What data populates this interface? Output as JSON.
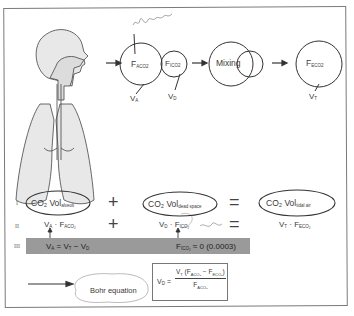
{
  "diagram": {
    "compartments": [
      {
        "id": "alveolar",
        "label": "F",
        "sub": "ACO2",
        "volume": "V",
        "volume_sub": "A"
      },
      {
        "id": "dead_space",
        "label": "F",
        "sub": "ICO2",
        "volume": "V",
        "volume_sub": "D"
      },
      {
        "id": "mixing",
        "label": "Mixing"
      },
      {
        "id": "expired",
        "label": "F",
        "sub": "ECO2",
        "volume": "V",
        "volume_sub": "T"
      }
    ],
    "handwritten_note_top": "fraction",
    "handwritten_note_mid": "~ V/g..."
  },
  "rows": {
    "row1": {
      "numeral": "I",
      "term1": {
        "main": "CO₂ Vol",
        "sub": "alveoli"
      },
      "op1": "+",
      "term2": {
        "main": "CO₂ Vol",
        "sub": "dead space"
      },
      "op2": "=",
      "term3": {
        "main": "CO₂ Vol",
        "sub": "tidal air"
      }
    },
    "row2": {
      "numeral": "II",
      "term1": {
        "a": "V",
        "a_sub": "A",
        "dot": " · F",
        "b_sub": "ACO₂"
      },
      "op1": "+",
      "term2": {
        "a": "V",
        "a_sub": "D",
        "dot": " · F",
        "b_sub": "ICO₂"
      },
      "op2": "=",
      "term3": {
        "a": "V",
        "a_sub": "T",
        "dot": " · F",
        "b_sub": "ECO₂"
      }
    },
    "row3": {
      "numeral": "III",
      "left": {
        "a": "V",
        "a_sub": "A",
        "rest1": " = V",
        "b_sub": "T",
        "rest2": " − V",
        "c_sub": "D"
      },
      "right": {
        "a": "F",
        "a_sub": "ICO₂",
        "rest": " ≈ 0 (0.0003)"
      }
    }
  },
  "bohr": {
    "label": "Bohr equation",
    "lhs": "V",
    "lhs_sub": "D",
    "equals": "=",
    "numerator": {
      "v": "V",
      "v_sub": "T",
      "open": " (F",
      "s1": "ACO₂",
      "minus": " − F",
      "s2": "ECO₂",
      "close": ")"
    },
    "denominator": {
      "f": "F",
      "f_sub": "ACO₂"
    }
  },
  "colors": {
    "body_fill": "#e8e8e8",
    "circle_fill": "#efefef",
    "bar": "#9a9a9a",
    "stroke": "#333333"
  }
}
